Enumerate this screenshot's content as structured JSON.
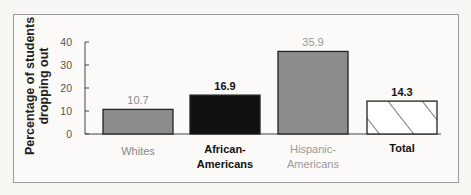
{
  "chart_data": {
    "type": "bar",
    "title": "",
    "xlabel": "",
    "ylabel": "Percentage of students dropping out",
    "ylabel_lines": [
      "Percentage of students",
      "dropping out"
    ],
    "ylim": [
      0,
      40
    ],
    "yticks": [
      0,
      10,
      20,
      30,
      40
    ],
    "grid": false,
    "legend": null,
    "categories": [
      "Whites",
      "African-Americans",
      "Hispanic-Americans",
      "Total"
    ],
    "category_label_lines": [
      [
        "Whites"
      ],
      [
        "African-",
        "Americans"
      ],
      [
        "Hispanic-",
        "Americans"
      ],
      [
        "Total"
      ]
    ],
    "values": [
      10.7,
      16.9,
      35.9,
      14.3
    ],
    "value_labels": [
      "10.7",
      "16.9",
      "35.9",
      "14.3"
    ],
    "bar_styles": [
      {
        "fill": "#8c8c8c",
        "pattern": "solid",
        "label_color": "#888888",
        "label_bold": false
      },
      {
        "fill": "#111111",
        "pattern": "solid",
        "label_color": "#111111",
        "label_bold": true
      },
      {
        "fill": "#8c8c8c",
        "pattern": "solid",
        "label_color": "#999999",
        "label_bold": false
      },
      {
        "fill": "#ffffff",
        "pattern": "diagonal-hatch",
        "label_color": "#111111",
        "label_bold": true
      }
    ]
  }
}
